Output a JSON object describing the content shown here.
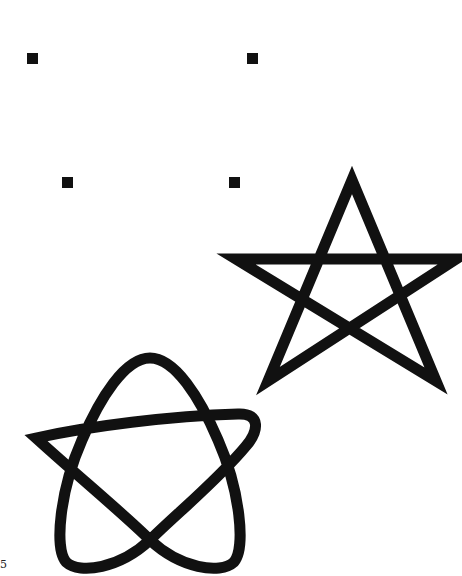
{
  "figure": {
    "stroke_color": "#111111",
    "background": "#ffffff",
    "markers": [
      {
        "name": "marker-top-left",
        "x": 27,
        "y": 53
      },
      {
        "name": "marker-top-right",
        "x": 247,
        "y": 53
      },
      {
        "name": "marker-mid-left",
        "x": 62,
        "y": 177
      },
      {
        "name": "marker-mid-right",
        "x": 229,
        "y": 177
      }
    ],
    "shapes": [
      {
        "name": "straight-pentagram",
        "kind": "pentagram",
        "style": "straight"
      },
      {
        "name": "curved-pentagram",
        "kind": "pentagram",
        "style": "curved"
      }
    ]
  },
  "page": {
    "number": "5"
  }
}
